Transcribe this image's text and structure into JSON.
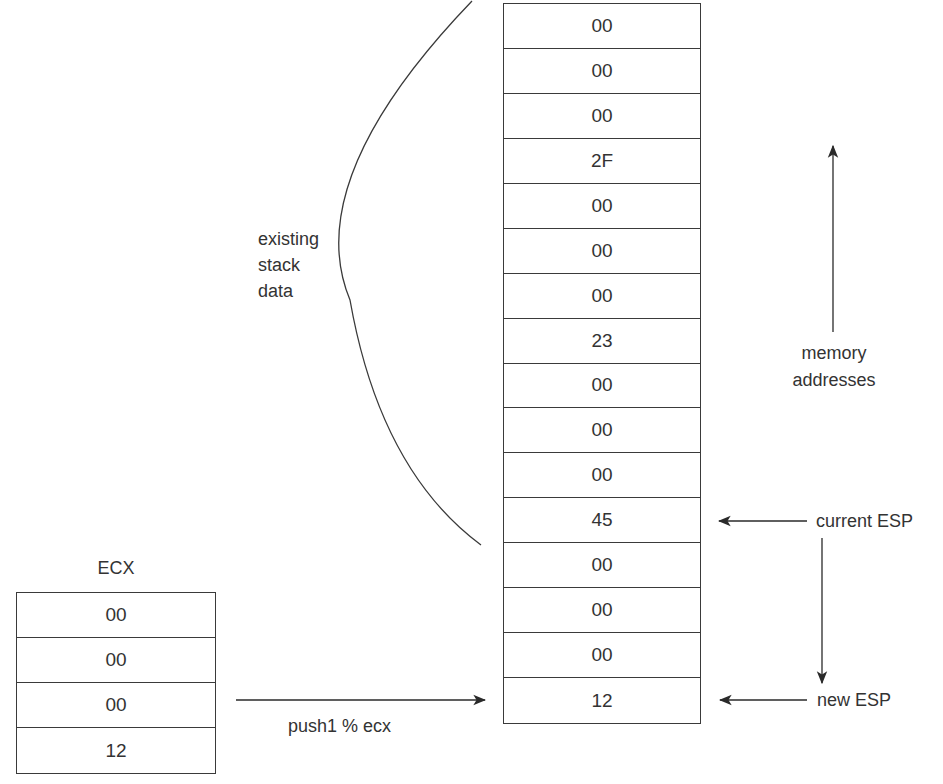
{
  "diagram": {
    "stack": {
      "cells": [
        "00",
        "00",
        "00",
        "2F",
        "00",
        "00",
        "00",
        "23",
        "00",
        "00",
        "00",
        "45",
        "00",
        "00",
        "00",
        "12"
      ]
    },
    "ecx": {
      "title": "ECX",
      "cells": [
        "00",
        "00",
        "00",
        "12"
      ]
    },
    "labels": {
      "existing_stack_data": [
        "existing",
        "stack",
        "data"
      ],
      "memory_addresses": [
        "memory",
        "addresses"
      ],
      "current_esp": "current ESP",
      "new_esp": "new ESP",
      "push_instruction": "push1 % ecx"
    },
    "colors": {
      "line": "#3a3a3a",
      "text": "#333333",
      "background": "#ffffff"
    }
  }
}
